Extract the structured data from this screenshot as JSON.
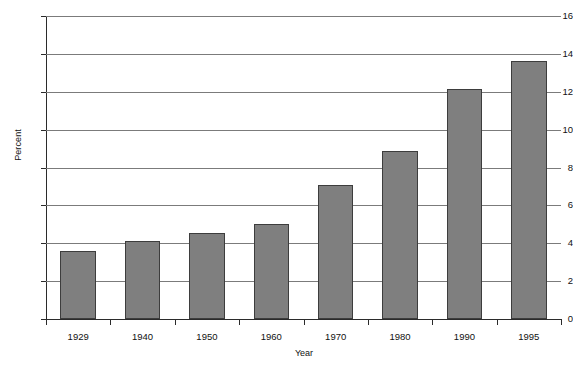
{
  "chart_data": {
    "type": "bar",
    "title": "",
    "xlabel": "Year",
    "ylabel": "Percent",
    "categories": [
      "1929",
      "1940",
      "1950",
      "1960",
      "1970",
      "1980",
      "1990",
      "1995"
    ],
    "values": [
      3.6,
      4.1,
      4.55,
      5.0,
      7.1,
      8.85,
      12.15,
      13.6
    ],
    "ylim": [
      0,
      16
    ],
    "ytick_step": 2,
    "yticks": [
      "16",
      "14",
      "12",
      "10",
      "8",
      "6",
      "4",
      "2",
      "0"
    ],
    "grid": "horizontal",
    "legend": "none",
    "series": [
      {
        "name": "Percent",
        "values": [
          3.6,
          4.1,
          4.55,
          5.0,
          7.1,
          8.85,
          12.15,
          13.6
        ]
      }
    ],
    "colors": {
      "bar_fill": "#7f7f7f",
      "bar_stroke": "#3d3d3d",
      "gridline": "#7b7b7b",
      "axis": "#2b2b2b",
      "background": "#ffffff",
      "text": "#111111"
    }
  }
}
